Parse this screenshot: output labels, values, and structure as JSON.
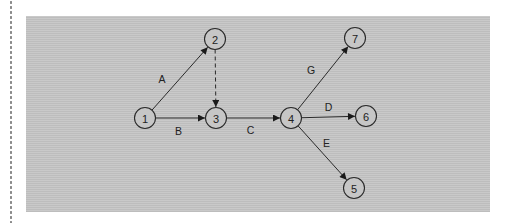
{
  "diagram": {
    "nodes": [
      {
        "id": "1",
        "label": "1"
      },
      {
        "id": "2",
        "label": "2"
      },
      {
        "id": "3",
        "label": "3"
      },
      {
        "id": "4",
        "label": "4"
      },
      {
        "id": "5",
        "label": "5"
      },
      {
        "id": "6",
        "label": "6"
      },
      {
        "id": "7",
        "label": "7"
      }
    ],
    "edges": [
      {
        "from": "1",
        "to": "2",
        "label": "A",
        "style": "solid"
      },
      {
        "from": "1",
        "to": "3",
        "label": "B",
        "style": "solid"
      },
      {
        "from": "2",
        "to": "3",
        "label": "",
        "style": "dashed"
      },
      {
        "from": "3",
        "to": "4",
        "label": "C",
        "style": "solid"
      },
      {
        "from": "4",
        "to": "6",
        "label": "D",
        "style": "solid"
      },
      {
        "from": "4",
        "to": "5",
        "label": "E",
        "style": "solid"
      },
      {
        "from": "4",
        "to": "7",
        "label": "G",
        "style": "solid"
      }
    ]
  }
}
